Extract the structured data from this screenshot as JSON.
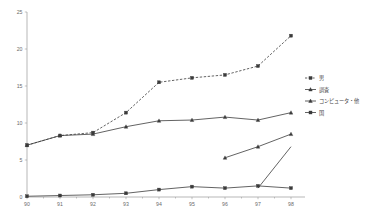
{
  "chart_data": {
    "type": "line",
    "title": "",
    "xlabel": "",
    "ylabel": "",
    "ylim": [
      0,
      25
    ],
    "xlim": [
      0,
      8
    ],
    "grid": false,
    "legend_position": "right",
    "categories": [
      "90",
      "91",
      "92",
      "93",
      "94",
      "95",
      "96",
      "97",
      "98"
    ],
    "yticks": [
      "0",
      "5",
      "10",
      "15",
      "20",
      "25"
    ],
    "ytick_values": [
      0,
      5,
      10,
      15,
      20,
      25
    ],
    "series": [
      {
        "name": "男",
        "style": "dashed",
        "marker": "square",
        "x": [
          0,
          1,
          2,
          3,
          4,
          5,
          6,
          7,
          8
        ],
        "values": [
          7.0,
          8.3,
          8.7,
          11.4,
          15.5,
          16.1,
          16.5,
          17.7,
          21.8
        ]
      },
      {
        "name": "調査",
        "style": "solid",
        "marker": "triangle",
        "x": [
          0,
          1,
          2,
          3,
          4,
          5,
          6,
          7,
          8
        ],
        "values": [
          7.0,
          8.3,
          8.5,
          9.5,
          10.3,
          10.4,
          10.8,
          10.4,
          11.4
        ]
      },
      {
        "name": "コンピュータ・他",
        "style": "solid",
        "marker": "triangle",
        "x": [
          6,
          7,
          8
        ],
        "values": [
          5.3,
          6.8,
          8.5
        ]
      },
      {
        "name": "国",
        "style": "solid",
        "marker": "square",
        "x": [
          0,
          1,
          2,
          3,
          4,
          5,
          6,
          7,
          8
        ],
        "values": [
          0.1,
          0.2,
          0.3,
          0.5,
          1.0,
          1.4,
          1.2,
          1.5,
          1.2
        ]
      },
      {
        "name": "",
        "style": "solid",
        "marker": "none",
        "x": [
          7,
          8
        ],
        "values": [
          1.2,
          6.8
        ]
      }
    ],
    "legend": [
      {
        "label": "男",
        "style": "dashed",
        "marker": "square"
      },
      {
        "label": "調査",
        "style": "solid",
        "marker": "triangle"
      },
      {
        "label": "コンピュータ・他",
        "style": "solid",
        "marker": "triangle"
      },
      {
        "label": "国",
        "style": "solid",
        "marker": "square"
      }
    ],
    "colors": {
      "line": "#3b3b3b",
      "axis": "#9a9a9a",
      "text": "#6b6b6b",
      "background": "#ffffff"
    }
  }
}
